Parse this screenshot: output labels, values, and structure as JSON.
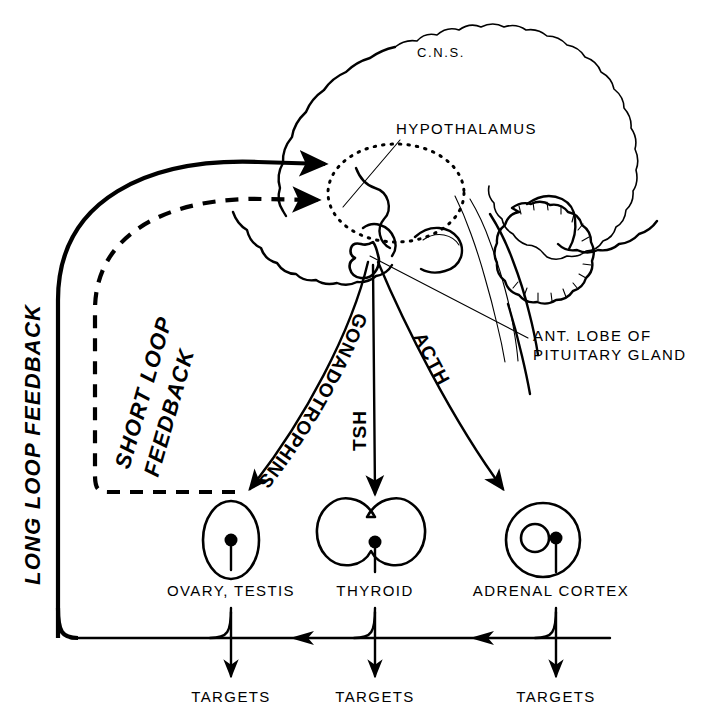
{
  "diagram": {
    "ink_color": "#000000",
    "background_color": "#ffffff"
  },
  "anatomy": {
    "cns_label": "C.N.S.",
    "hypothalamus_label": "HYPOTHALAMUS",
    "pituitary_label_line1": "ANT. LOBE OF",
    "pituitary_label_line2": "PITUITARY GLAND"
  },
  "hormones": {
    "gonadotrophins": "GONADOTROPHINS",
    "tsh": "TSH",
    "acth": "ACTH"
  },
  "feedback": {
    "long_loop": "LONG LOOP FEEDBACK",
    "short_loop_line1": "SHORT LOOP",
    "short_loop_line2": "FEEDBACK"
  },
  "organs": [
    {
      "id": "gonad",
      "label": "OVARY, TESTIS",
      "shape": "ellipse",
      "target_label": "TARGETS"
    },
    {
      "id": "thyroid",
      "label": "THYROID",
      "shape": "butterfly",
      "target_label": "TARGETS"
    },
    {
      "id": "adrenal",
      "label": "ADRENAL CORTEX",
      "shape": "circle-in-circle",
      "target_label": "TARGETS"
    }
  ],
  "targets": {
    "gonad": "TARGETS",
    "thyroid": "TARGETS",
    "adrenal": "TARGETS"
  }
}
